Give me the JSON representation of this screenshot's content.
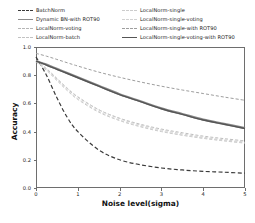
{
  "chart_data": {
    "type": "line",
    "title": "",
    "xlabel": "Noise level(sigma)",
    "ylabel": "Accuracy",
    "xlim": [
      0,
      5
    ],
    "ylim": [
      0.0,
      1.0
    ],
    "xticks": [
      0,
      1,
      2,
      3,
      4,
      5
    ],
    "xticklabels": [
      "0",
      "1",
      "2",
      "3",
      "4",
      "5"
    ],
    "yticks": [
      0.0,
      0.2,
      0.4,
      0.6,
      0.8,
      1.0
    ],
    "yticklabels": [
      "0.0",
      "0.2",
      "0.4",
      "0.6",
      "0.8",
      "1.0"
    ],
    "grid": false,
    "legend_position": "above-axes",
    "legend_columns": 2,
    "x": [
      0,
      0.25,
      0.5,
      0.75,
      1,
      1.5,
      2,
      2.5,
      3,
      3.5,
      4,
      4.5,
      5
    ],
    "series": [
      {
        "name": "BatchNorm",
        "color": "#3a3a3a",
        "linestyle": "dashed",
        "linewidth": 1.2,
        "values": [
          0.93,
          0.8,
          0.64,
          0.5,
          0.4,
          0.27,
          0.2,
          0.165,
          0.142,
          0.128,
          0.118,
          0.112,
          0.105
        ]
      },
      {
        "name": "Dynamic BN-with ROT90",
        "color": "#8a8a8a",
        "linestyle": "solid",
        "linewidth": 2.2,
        "values": [
          0.9,
          0.875,
          0.845,
          0.815,
          0.785,
          0.725,
          0.665,
          0.615,
          0.565,
          0.525,
          0.485,
          0.455,
          0.425
        ]
      },
      {
        "name": "LocalNorm-voting",
        "color": "#b5b5b5",
        "linestyle": "dashed",
        "linewidth": 0.9,
        "values": [
          0.9,
          0.845,
          0.775,
          0.705,
          0.645,
          0.555,
          0.495,
          0.452,
          0.418,
          0.392,
          0.368,
          0.35,
          0.334
        ]
      },
      {
        "name": "LocalNorm-batch",
        "color": "#c2c2c2",
        "linestyle": "dashed",
        "linewidth": 0.9,
        "values": [
          0.895,
          0.835,
          0.762,
          0.69,
          0.628,
          0.538,
          0.478,
          0.434,
          0.4,
          0.374,
          0.352,
          0.334,
          0.318
        ]
      },
      {
        "name": "LocalNorm-single",
        "color": "#cccccc",
        "linestyle": "dashed",
        "linewidth": 0.9,
        "values": [
          0.905,
          0.848,
          0.778,
          0.708,
          0.648,
          0.556,
          0.492,
          0.446,
          0.412,
          0.384,
          0.36,
          0.342,
          0.326
        ]
      },
      {
        "name": "LocalNorm-single-voting",
        "color": "#d2d2d2",
        "linestyle": "dashed",
        "linewidth": 0.9,
        "values": [
          0.9,
          0.84,
          0.768,
          0.696,
          0.634,
          0.544,
          0.482,
          0.438,
          0.404,
          0.376,
          0.354,
          0.336,
          0.32
        ]
      },
      {
        "name": "LocalNorm-single-with ROT90",
        "color": "#9e9e9e",
        "linestyle": "dashed",
        "linewidth": 1.0,
        "values": [
          0.955,
          0.935,
          0.912,
          0.888,
          0.865,
          0.822,
          0.785,
          0.752,
          0.722,
          0.695,
          0.67,
          0.645,
          0.622
        ]
      },
      {
        "name": "LocalNorm-single-voting-with ROT90",
        "color": "#555555",
        "linestyle": "solid",
        "linewidth": 1.4,
        "values": [
          0.9,
          0.872,
          0.842,
          0.812,
          0.782,
          0.722,
          0.662,
          0.612,
          0.562,
          0.522,
          0.482,
          0.452,
          0.422
        ]
      }
    ]
  },
  "legend": {
    "column_left": [
      {
        "label": "BatchNorm"
      },
      {
        "label": "Dynamic BN-with ROT90"
      },
      {
        "label": "LocalNorm-voting"
      },
      {
        "label": "LocalNorm-batch"
      }
    ],
    "column_right": [
      {
        "label": "LocalNorm-single"
      },
      {
        "label": "LocalNorm-single-voting"
      },
      {
        "label": "LocalNorm-single-with ROT90"
      },
      {
        "label": "LocalNorm-single-voting-with ROT90"
      }
    ]
  }
}
